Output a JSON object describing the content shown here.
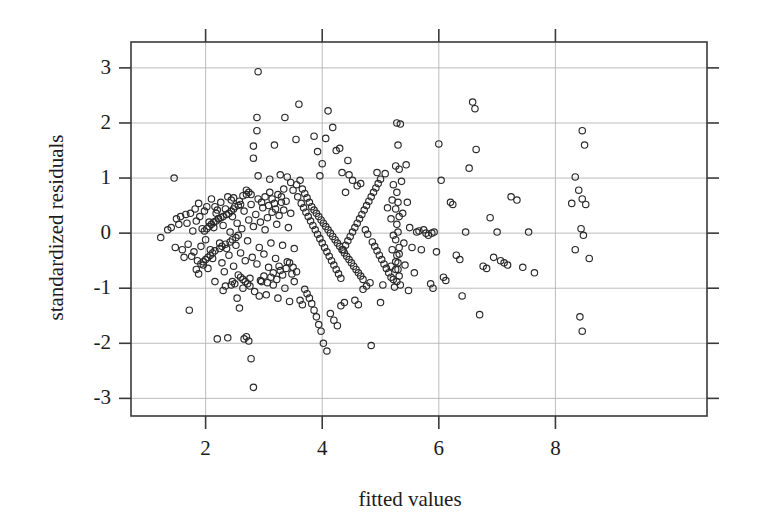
{
  "chart_data": {
    "type": "scatter",
    "title": "",
    "xlabel": "fitted values",
    "ylabel": "standardized residuals",
    "xlim": [
      0.72,
      10.6
    ],
    "ylim": [
      -3.32,
      3.47
    ],
    "xticks": [
      2,
      4,
      6,
      8
    ],
    "yticks": [
      3,
      2,
      1,
      0,
      -1,
      -2,
      -3
    ],
    "xtick_labels": [
      "2",
      "4",
      "6",
      "8"
    ],
    "ytick_labels": [
      "3",
      "2",
      "1",
      "0",
      "-1",
      "-2",
      "-3"
    ],
    "grid": true,
    "grid_color": "#b4b4b4",
    "frame_color": "#3a3a3a",
    "marker": {
      "shape": "open-circle",
      "diameter_px": 6.4,
      "stroke_color": "#2a2a2a",
      "stroke_width_px": 1.15,
      "fill": "none"
    },
    "n_points": 392,
    "legend": null,
    "points": [
      [
        1.23,
        -0.08
      ],
      [
        1.35,
        0.06
      ],
      [
        1.41,
        0.1
      ],
      [
        1.46,
        1.0
      ],
      [
        1.48,
        -0.26
      ],
      [
        1.5,
        0.26
      ],
      [
        1.54,
        0.16
      ],
      [
        1.57,
        0.3
      ],
      [
        1.6,
        -0.3
      ],
      [
        1.63,
        -0.44
      ],
      [
        1.66,
        0.34
      ],
      [
        1.68,
        0.18
      ],
      [
        1.7,
        -0.2
      ],
      [
        1.72,
        -1.4
      ],
      [
        1.74,
        0.36
      ],
      [
        1.76,
        -0.42
      ],
      [
        1.78,
        0.04
      ],
      [
        1.8,
        -0.34
      ],
      [
        1.82,
        0.44
      ],
      [
        1.84,
        0.22
      ],
      [
        1.86,
        -0.5
      ],
      [
        1.88,
        0.54
      ],
      [
        1.9,
        0.3
      ],
      [
        1.92,
        -0.24
      ],
      [
        1.94,
        0.08
      ],
      [
        1.96,
        -0.58
      ],
      [
        1.98,
        0.4
      ],
      [
        2.0,
        -0.12
      ],
      [
        2.02,
        0.48
      ],
      [
        2.04,
        -0.64
      ],
      [
        2.06,
        0.2
      ],
      [
        2.08,
        -0.3
      ],
      [
        2.1,
        0.62
      ],
      [
        2.12,
        -0.46
      ],
      [
        2.14,
        0.1
      ],
      [
        2.16,
        -0.88
      ],
      [
        2.18,
        0.36
      ],
      [
        2.2,
        -1.92
      ],
      [
        2.22,
        0.26
      ],
      [
        2.24,
        -0.18
      ],
      [
        2.26,
        0.56
      ],
      [
        2.28,
        -0.54
      ],
      [
        2.3,
        0.14
      ],
      [
        2.32,
        -0.7
      ],
      [
        2.34,
        0.44
      ],
      [
        2.36,
        -0.28
      ],
      [
        2.38,
        0.66
      ],
      [
        2.4,
        -0.4
      ],
      [
        2.42,
        0.02
      ],
      [
        2.44,
        -0.94
      ],
      [
        2.46,
        0.3
      ],
      [
        2.48,
        -0.6
      ],
      [
        2.5,
        0.48
      ],
      [
        2.52,
        -0.22
      ],
      [
        2.54,
        0.18
      ],
      [
        2.56,
        -0.76
      ],
      [
        2.58,
        0.58
      ],
      [
        2.6,
        -0.36
      ],
      [
        2.62,
        0.08
      ],
      [
        2.64,
        -1.0
      ],
      [
        2.66,
        0.4
      ],
      [
        2.68,
        -0.5
      ],
      [
        2.7,
        0.7
      ],
      [
        2.72,
        -0.14
      ],
      [
        2.74,
        0.24
      ],
      [
        2.76,
        -0.82
      ],
      [
        2.78,
        0.52
      ],
      [
        2.8,
        -0.44
      ],
      [
        2.82,
        0.12
      ],
      [
        2.84,
        -1.06
      ],
      [
        2.86,
        0.34
      ],
      [
        2.88,
        -0.56
      ],
      [
        2.9,
        2.93
      ],
      [
        2.9,
        0.62
      ],
      [
        2.92,
        -0.26
      ],
      [
        2.94,
        0.2
      ],
      [
        2.96,
        -0.88
      ],
      [
        2.98,
        0.46
      ],
      [
        3.0,
        -0.38
      ],
      [
        3.02,
        0.06
      ],
      [
        3.04,
        -1.12
      ],
      [
        3.06,
        0.28
      ],
      [
        3.08,
        -0.62
      ],
      [
        3.1,
        0.74
      ],
      [
        3.12,
        -0.18
      ],
      [
        3.14,
        0.38
      ],
      [
        3.16,
        -0.94
      ],
      [
        3.18,
        0.54
      ],
      [
        3.2,
        -0.46
      ],
      [
        3.22,
        0.16
      ],
      [
        3.24,
        -1.18
      ],
      [
        3.26,
        0.32
      ],
      [
        3.28,
        -0.68
      ],
      [
        3.3,
        0.66
      ],
      [
        3.32,
        -0.22
      ],
      [
        3.34,
        0.42
      ],
      [
        3.36,
        -1.0
      ],
      [
        3.38,
        0.58
      ],
      [
        3.4,
        -0.52
      ],
      [
        3.42,
        0.1
      ],
      [
        3.44,
        -1.24
      ],
      [
        3.46,
        0.36
      ],
      [
        3.48,
        -0.74
      ],
      [
        3.5,
        0.78
      ],
      [
        3.52,
        -0.28
      ],
      [
        2.88,
        2.1
      ],
      [
        2.88,
        1.86
      ],
      [
        2.82,
        1.58
      ],
      [
        2.82,
        1.36
      ],
      [
        2.9,
        1.04
      ],
      [
        3.18,
        1.6
      ],
      [
        3.36,
        2.1
      ],
      [
        3.28,
        1.06
      ],
      [
        3.1,
        0.98
      ],
      [
        2.7,
        0.78
      ],
      [
        2.74,
        0.74
      ],
      [
        2.78,
        0.7
      ],
      [
        2.64,
        0.68
      ],
      [
        2.6,
        0.52
      ],
      [
        2.56,
        0.5
      ],
      [
        2.48,
        0.44
      ],
      [
        2.44,
        0.4
      ],
      [
        2.4,
        0.36
      ],
      [
        2.36,
        0.34
      ],
      [
        2.3,
        0.3
      ],
      [
        2.26,
        0.28
      ],
      [
        2.22,
        0.26
      ],
      [
        2.18,
        0.22
      ],
      [
        2.14,
        0.2
      ],
      [
        2.1,
        0.16
      ],
      [
        2.06,
        0.12
      ],
      [
        2.02,
        0.08
      ],
      [
        1.98,
        0.04
      ],
      [
        2.56,
        -0.04
      ],
      [
        2.52,
        -0.08
      ],
      [
        2.46,
        -0.12
      ],
      [
        2.42,
        -0.16
      ],
      [
        2.34,
        -0.2
      ],
      [
        2.28,
        -0.24
      ],
      [
        2.24,
        -0.28
      ],
      [
        2.16,
        -0.32
      ],
      [
        2.12,
        -0.36
      ],
      [
        2.08,
        -0.4
      ],
      [
        2.04,
        -0.44
      ],
      [
        2.0,
        -0.48
      ],
      [
        1.96,
        -0.52
      ],
      [
        1.92,
        -0.56
      ],
      [
        2.6,
        -0.8
      ],
      [
        2.64,
        -0.84
      ],
      [
        2.68,
        -0.88
      ],
      [
        2.72,
        -0.92
      ],
      [
        2.76,
        -0.96
      ],
      [
        2.5,
        -0.92
      ],
      [
        2.46,
        -0.88
      ],
      [
        2.54,
        -1.18
      ],
      [
        2.58,
        -1.36
      ],
      [
        2.66,
        -1.92
      ],
      [
        2.7,
        -1.88
      ],
      [
        2.74,
        -1.96
      ],
      [
        2.78,
        -2.28
      ],
      [
        2.82,
        -2.8
      ],
      [
        2.38,
        -1.9
      ],
      [
        3.6,
        2.34
      ],
      [
        3.55,
        1.7
      ],
      [
        3.62,
        0.96
      ],
      [
        3.66,
        0.8
      ],
      [
        3.7,
        0.72
      ],
      [
        3.74,
        0.64
      ],
      [
        3.78,
        0.56
      ],
      [
        3.82,
        0.48
      ],
      [
        3.86,
        0.42
      ],
      [
        3.9,
        0.36
      ],
      [
        3.94,
        0.3
      ],
      [
        3.98,
        0.24
      ],
      [
        4.02,
        0.18
      ],
      [
        4.06,
        0.12
      ],
      [
        4.1,
        0.06
      ],
      [
        4.14,
        0.0
      ],
      [
        4.18,
        -0.06
      ],
      [
        4.22,
        -0.12
      ],
      [
        4.26,
        -0.18
      ],
      [
        4.3,
        -0.24
      ],
      [
        4.34,
        -0.3
      ],
      [
        4.38,
        -0.36
      ],
      [
        4.42,
        -0.42
      ],
      [
        4.46,
        -0.48
      ],
      [
        4.5,
        -0.54
      ],
      [
        4.54,
        -0.6
      ],
      [
        4.58,
        -0.66
      ],
      [
        4.62,
        -0.72
      ],
      [
        4.66,
        -0.78
      ],
      [
        4.7,
        -0.84
      ],
      [
        3.56,
        0.88
      ],
      [
        3.58,
        0.66
      ],
      [
        3.64,
        0.54
      ],
      [
        3.68,
        0.46
      ],
      [
        3.72,
        0.38
      ],
      [
        3.76,
        0.3
      ],
      [
        3.8,
        0.22
      ],
      [
        3.84,
        0.14
      ],
      [
        3.88,
        0.06
      ],
      [
        3.92,
        -0.02
      ],
      [
        3.96,
        -0.1
      ],
      [
        4.0,
        -0.18
      ],
      [
        4.04,
        -0.26
      ],
      [
        4.08,
        -0.34
      ],
      [
        4.12,
        -0.42
      ],
      [
        4.16,
        -0.5
      ],
      [
        4.2,
        -0.58
      ],
      [
        4.24,
        -0.66
      ],
      [
        4.28,
        -0.74
      ],
      [
        4.32,
        -0.82
      ],
      [
        4.36,
        -0.3
      ],
      [
        4.4,
        -0.22
      ],
      [
        4.44,
        -0.14
      ],
      [
        4.48,
        -0.06
      ],
      [
        4.52,
        0.02
      ],
      [
        4.56,
        0.1
      ],
      [
        4.6,
        0.18
      ],
      [
        4.64,
        0.26
      ],
      [
        4.68,
        0.34
      ],
      [
        4.72,
        0.42
      ],
      [
        4.76,
        0.5
      ],
      [
        4.8,
        0.58
      ],
      [
        4.84,
        0.66
      ],
      [
        4.88,
        0.74
      ],
      [
        4.92,
        0.82
      ],
      [
        4.96,
        0.9
      ],
      [
        5.0,
        0.98
      ],
      [
        4.1,
        2.22
      ],
      [
        4.18,
        1.92
      ],
      [
        4.06,
        1.72
      ],
      [
        4.24,
        1.5
      ],
      [
        4.3,
        1.54
      ],
      [
        4.34,
        1.1
      ],
      [
        4.46,
        1.06
      ],
      [
        4.52,
        0.96
      ],
      [
        4.6,
        0.86
      ],
      [
        4.66,
        0.9
      ],
      [
        3.86,
        1.76
      ],
      [
        3.92,
        1.48
      ],
      [
        4.0,
        1.26
      ],
      [
        3.96,
        1.04
      ],
      [
        4.44,
        1.32
      ],
      [
        4.4,
        0.74
      ],
      [
        4.86,
        -0.16
      ],
      [
        4.9,
        -0.24
      ],
      [
        4.94,
        -0.32
      ],
      [
        4.98,
        -0.4
      ],
      [
        5.02,
        -0.48
      ],
      [
        5.06,
        -0.56
      ],
      [
        5.1,
        -0.64
      ],
      [
        5.14,
        -0.72
      ],
      [
        5.18,
        -0.8
      ],
      [
        3.7,
        -1.02
      ],
      [
        3.74,
        -1.1
      ],
      [
        3.78,
        -1.18
      ],
      [
        3.82,
        -1.28
      ],
      [
        3.86,
        -1.4
      ],
      [
        3.9,
        -1.52
      ],
      [
        3.94,
        -1.66
      ],
      [
        3.98,
        -1.78
      ],
      [
        4.02,
        -2.0
      ],
      [
        4.08,
        -2.14
      ],
      [
        3.62,
        -1.22
      ],
      [
        3.66,
        -1.3
      ],
      [
        4.14,
        -1.46
      ],
      [
        4.2,
        -1.58
      ],
      [
        4.26,
        -1.68
      ],
      [
        4.32,
        -1.32
      ],
      [
        4.38,
        -1.26
      ],
      [
        4.56,
        -1.22
      ],
      [
        4.62,
        -1.3
      ],
      [
        4.7,
        -1.02
      ],
      [
        4.76,
        -0.96
      ],
      [
        4.82,
        -0.9
      ],
      [
        5.28,
        2.0
      ],
      [
        5.34,
        1.98
      ],
      [
        5.3,
        1.6
      ],
      [
        5.26,
        1.22
      ],
      [
        5.32,
        1.16
      ],
      [
        5.28,
        0.74
      ],
      [
        5.3,
        0.56
      ],
      [
        5.26,
        0.44
      ],
      [
        5.32,
        0.3
      ],
      [
        5.28,
        0.16
      ],
      [
        5.3,
        0.02
      ],
      [
        5.26,
        -0.12
      ],
      [
        5.32,
        -0.26
      ],
      [
        5.28,
        -0.4
      ],
      [
        5.3,
        -0.54
      ],
      [
        5.26,
        -0.66
      ],
      [
        5.32,
        -0.78
      ],
      [
        5.28,
        -0.88
      ],
      [
        5.34,
        -0.94
      ],
      [
        5.24,
        -0.98
      ],
      [
        5.3,
        -0.66
      ],
      [
        5.26,
        -0.52
      ],
      [
        5.32,
        -0.38
      ],
      [
        5.22,
        0.88
      ],
      [
        5.2,
        0.6
      ],
      [
        5.18,
        0.26
      ],
      [
        5.22,
        -0.04
      ],
      [
        5.2,
        -0.3
      ],
      [
        5.18,
        -0.6
      ],
      [
        5.22,
        -0.84
      ],
      [
        5.36,
        0.94
      ],
      [
        5.38,
        0.36
      ],
      [
        5.4,
        -0.18
      ],
      [
        5.42,
        -0.58
      ],
      [
        4.84,
        -2.04
      ],
      [
        5.08,
        1.08
      ],
      [
        5.12,
        0.46
      ],
      [
        5.04,
        -0.94
      ],
      [
        5.46,
        0.56
      ],
      [
        5.5,
        0.1
      ],
      [
        5.54,
        -0.26
      ],
      [
        5.58,
        -0.72
      ],
      [
        5.62,
        0.02
      ],
      [
        5.66,
        0.04
      ],
      [
        5.7,
        -0.3
      ],
      [
        5.74,
        0.06
      ],
      [
        5.78,
        0.0
      ],
      [
        5.82,
        -0.04
      ],
      [
        5.88,
        0.0
      ],
      [
        5.92,
        0.02
      ],
      [
        5.96,
        -0.34
      ],
      [
        6.0,
        1.62
      ],
      [
        6.04,
        0.96
      ],
      [
        6.08,
        -0.8
      ],
      [
        6.12,
        -0.86
      ],
      [
        5.86,
        -0.92
      ],
      [
        5.9,
        -1.0
      ],
      [
        6.2,
        0.56
      ],
      [
        6.24,
        0.52
      ],
      [
        6.3,
        -0.4
      ],
      [
        6.36,
        -0.48
      ],
      [
        6.4,
        -1.14
      ],
      [
        6.46,
        0.02
      ],
      [
        6.52,
        1.18
      ],
      [
        6.58,
        2.38
      ],
      [
        6.62,
        2.26
      ],
      [
        6.64,
        1.52
      ],
      [
        6.7,
        -1.48
      ],
      [
        6.76,
        -0.6
      ],
      [
        6.82,
        -0.64
      ],
      [
        6.88,
        0.28
      ],
      [
        6.94,
        -0.44
      ],
      [
        7.0,
        0.02
      ],
      [
        7.06,
        -0.5
      ],
      [
        7.12,
        -0.54
      ],
      [
        7.18,
        -0.58
      ],
      [
        7.24,
        0.66
      ],
      [
        7.34,
        0.6
      ],
      [
        7.44,
        -0.62
      ],
      [
        7.54,
        0.02
      ],
      [
        7.64,
        -0.72
      ],
      [
        8.34,
        1.02
      ],
      [
        8.4,
        0.78
      ],
      [
        8.46,
        1.86
      ],
      [
        8.5,
        1.6
      ],
      [
        8.46,
        0.62
      ],
      [
        8.52,
        0.52
      ],
      [
        8.44,
        0.08
      ],
      [
        8.48,
        -0.04
      ],
      [
        8.42,
        -1.52
      ],
      [
        8.46,
        -1.78
      ],
      [
        8.58,
        -0.46
      ],
      [
        8.28,
        0.54
      ],
      [
        8.34,
        -0.3
      ],
      [
        5.44,
        1.24
      ],
      [
        5.48,
        -1.04
      ],
      [
        4.94,
        1.1
      ],
      [
        5.0,
        -1.26
      ],
      [
        3.52,
        -0.88
      ],
      [
        3.46,
        0.92
      ],
      [
        3.4,
        1.02
      ],
      [
        3.34,
        0.8
      ],
      [
        3.3,
        0.56
      ],
      [
        3.24,
        0.7
      ],
      [
        3.2,
        0.44
      ],
      [
        3.14,
        0.62
      ],
      [
        3.08,
        0.5
      ],
      [
        3.02,
        0.66
      ],
      [
        2.96,
        0.56
      ],
      [
        3.56,
        -0.7
      ],
      [
        3.5,
        -0.62
      ],
      [
        3.44,
        -0.54
      ],
      [
        3.38,
        -0.64
      ],
      [
        3.32,
        -0.76
      ],
      [
        3.26,
        -0.6
      ],
      [
        3.22,
        -0.84
      ],
      [
        3.16,
        -0.72
      ],
      [
        3.12,
        -0.8
      ],
      [
        3.06,
        -0.9
      ],
      [
        3.0,
        -0.78
      ],
      [
        2.94,
        -0.86
      ],
      [
        2.92,
        -1.14
      ],
      [
        4.74,
        0.06
      ],
      [
        4.78,
        -0.02
      ],
      [
        2.34,
        -0.96
      ],
      [
        2.3,
        -1.04
      ],
      [
        1.88,
        -0.74
      ],
      [
        1.84,
        -0.66
      ],
      [
        2.44,
        0.6
      ],
      [
        2.48,
        0.64
      ],
      [
        2.2,
        0.42
      ],
      [
        2.16,
        0.48
      ]
    ]
  }
}
